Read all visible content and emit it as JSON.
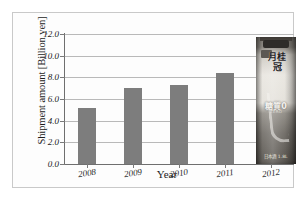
{
  "chart_data": {
    "type": "bar",
    "title": "",
    "xlabel": "Year",
    "ylabel": "Shipment amount [Billion yen]",
    "categories": [
      "2008",
      "2009",
      "2010",
      "2011",
      "2012"
    ],
    "values": [
      5.2,
      7.0,
      7.3,
      8.4,
      10.9
    ],
    "series": [
      {
        "name": "Shipment amount",
        "values": [
          5.2,
          7.0,
          7.3,
          8.4,
          10.9
        ]
      }
    ],
    "ylim": [
      0.0,
      12.0
    ],
    "ytick_labels": [
      "12.0",
      "10.0",
      "8.0",
      "6.0",
      "4.0",
      "2.0",
      "0.0"
    ],
    "ytick_values": [
      12.0,
      10.0,
      8.0,
      6.0,
      4.0,
      2.0,
      0.0
    ],
    "ytick_step": 2.0,
    "grid": true,
    "legend": "none",
    "bar_color": "#7d7d7d",
    "grid_color": "#b9b9b9",
    "axis_color": "#6f6f6f"
  },
  "annotation": {
    "product_photo": {
      "name": "sake-carton-photo",
      "brand_text": "月桂冠",
      "top_text": "特別純米",
      "badge_text": "新",
      "zero_text": "糖質0",
      "sub_text": "ZERO",
      "bottom_text": "日本酒 1.8L"
    }
  },
  "figure": {
    "background": "#ffffff",
    "frame_color": "#c9c9c9"
  }
}
